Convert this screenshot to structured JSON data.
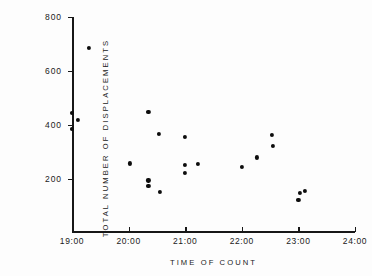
{
  "chart_data": {
    "type": "scatter",
    "title": "",
    "xlabel": "TIME OF COUNT",
    "ylabel": "TOTAL NUMBER OF DISPLACEMENTS",
    "xlim": [
      19.0,
      24.0
    ],
    "ylim": [
      0,
      800
    ],
    "grid": false,
    "legend": null,
    "xtick_labels": [
      "19:00",
      "20:00",
      "21:00",
      "22:00",
      "23:00",
      "24:00"
    ],
    "xtick_values": [
      19.0,
      20.0,
      21.0,
      22.0,
      23.0,
      24.0
    ],
    "ytick_labels": [
      "200",
      "400",
      "600",
      "800"
    ],
    "ytick_values": [
      200,
      400,
      600,
      800
    ],
    "series": [
      {
        "name": "displacements",
        "marker": "filled-circle",
        "color": "#0d0d0d",
        "points": [
          {
            "x": 19.0,
            "y": 445
          },
          {
            "x": 19.0,
            "y": 385
          },
          {
            "x": 19.1,
            "y": 418
          },
          {
            "x": 19.3,
            "y": 685
          },
          {
            "x": 20.03,
            "y": 258
          },
          {
            "x": 20.35,
            "y": 450
          },
          {
            "x": 20.35,
            "y": 195
          },
          {
            "x": 20.35,
            "y": 175
          },
          {
            "x": 20.53,
            "y": 368
          },
          {
            "x": 20.55,
            "y": 153
          },
          {
            "x": 21.0,
            "y": 355
          },
          {
            "x": 21.0,
            "y": 252
          },
          {
            "x": 21.0,
            "y": 224
          },
          {
            "x": 21.22,
            "y": 255
          },
          {
            "x": 22.0,
            "y": 246
          },
          {
            "x": 22.26,
            "y": 280
          },
          {
            "x": 22.53,
            "y": 362
          },
          {
            "x": 22.55,
            "y": 322
          },
          {
            "x": 23.0,
            "y": 122
          },
          {
            "x": 23.02,
            "y": 150
          },
          {
            "x": 23.12,
            "y": 157
          }
        ]
      }
    ]
  }
}
